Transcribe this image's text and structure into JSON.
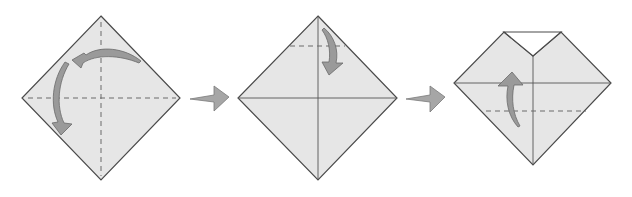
{
  "diagram": {
    "type": "origami-instructions",
    "steps": [
      {
        "index": 1,
        "shape": "square-diamond",
        "lines": [
          "horizontal-valley-fold-dashed",
          "vertical-valley-fold-dashed"
        ],
        "arrows": [
          "curved-fold-arrow-top-right-to-left",
          "curved-fold-arrow-left-to-bottom"
        ]
      },
      {
        "index": 2,
        "shape": "square-diamond",
        "lines": [
          "horizontal-crease",
          "vertical-crease",
          "top-valley-fold-dashed"
        ],
        "arrows": [
          "curved-fold-arrow-top-down"
        ]
      },
      {
        "index": 3,
        "shape": "diamond-with-folded-top",
        "lines": [
          "vertical-crease",
          "horizontal-edge",
          "lower-valley-fold-dashed"
        ],
        "arrows": [
          "curved-fold-arrow-bottom-up"
        ]
      }
    ],
    "transitions": [
      "step-arrow-right",
      "step-arrow-right"
    ],
    "colors": {
      "paper": "#e6e6e6",
      "outline": "#4a4a4a",
      "arrow": "#9a9a9a",
      "background": "#ffffff"
    }
  }
}
